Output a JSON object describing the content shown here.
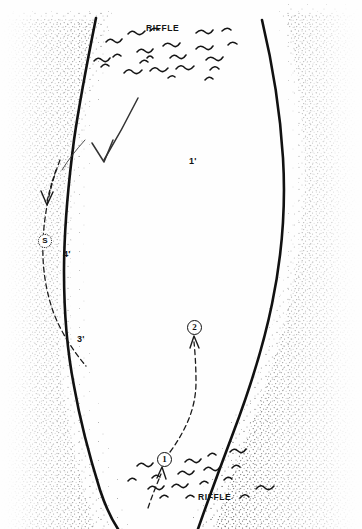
{
  "figure": {
    "kind": "stream-pool-diagram",
    "width": 362,
    "height": 529,
    "background_color": "#ffffff",
    "ink_color": "#111111",
    "stipple_color": "#3a3a3a"
  },
  "labels": {
    "riffle_top": "RIFFLE",
    "riffle_bottom": "RIFFLE",
    "depth_right": "1'",
    "depth_mid_left": "4'",
    "depth_lower_left": "3'"
  },
  "markers": [
    {
      "id": "structure",
      "text": "S",
      "style": "dotted-circle",
      "x": 45,
      "y": 241
    },
    {
      "id": "position-two",
      "text": "2",
      "style": "solid-circle",
      "x": 194,
      "y": 327
    },
    {
      "id": "position-one",
      "text": "1",
      "style": "solid-circle",
      "x": 164,
      "y": 459
    }
  ],
  "features": {
    "left_bank": "stippled gravel bar along left margin",
    "right_bank": "stippled gravel bar along right margin",
    "flow_arrow": "large downstream flow arrow in upper pool",
    "seam_arrow": "small dashed arrow at left bank seam",
    "approach_path": "dashed angler approach path from position 1 to position 2",
    "cast_path": "dashed cast line entering position 1 from lower riffle"
  }
}
